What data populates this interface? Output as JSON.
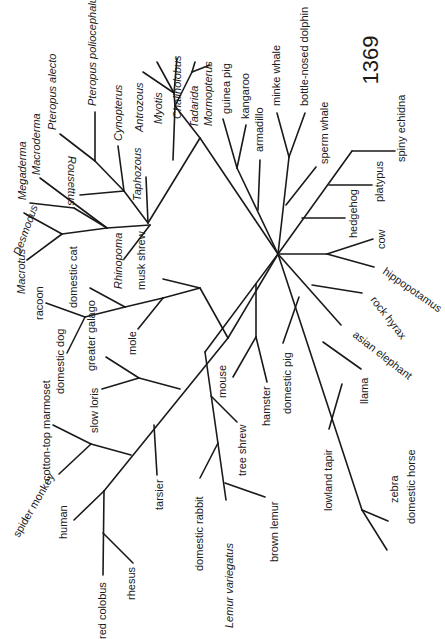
{
  "page": {
    "number": "1369"
  },
  "figure": {
    "type": "unrooted phylogenetic tree (rotated 90°)",
    "taxa": {
      "pteropus_poliocephalus": "Pteropus poliocephalus",
      "pteropus_alecto": "Pteropus alecto",
      "cynopterus": "Cynopterus",
      "antrozous": "Antrozous",
      "myotis": "Myotis",
      "chalinolobus": "Chalinolobus",
      "tadarida": "Tadarida",
      "mormopterus": "Mormopterus",
      "macroderma": "Macroderma",
      "megaderma": "Megaderma",
      "rousettus": "Rousettus",
      "desmodus": "Desmodus",
      "taphozous": "Taphozous",
      "macrotus": "Macrotus",
      "rhinopoma": "Rhinopoma",
      "guinea_pig": "guinea pig",
      "kangaroo": "kangaroo",
      "armadillo": "armadillo",
      "minke_whale": "minke whale",
      "bottle_nosed_dolphin": "bottle-nosed dolphin",
      "sperm_whale": "sperm whale",
      "spiny_echidna": "spiny echidna",
      "platypus": "platypus",
      "hedgehog": "hedgehog",
      "cow": "cow",
      "hippopotamus": "hippopotamus",
      "rock_hyrax": "rock hyrax",
      "asian_elephant": "asian elephant",
      "llama": "llama",
      "domestic_pig": "domestic pig",
      "lowland_tapir": "lowland tapir",
      "zebra": "zebra",
      "domestic_horse": "domestic horse",
      "racoon": "racoon",
      "domestic_cat": "domestic cat",
      "musk_shrew": "musk shrew",
      "domestic_dog": "domestic dog",
      "mole": "mole",
      "greater_galago": "greater galago",
      "slow_loris": "slow loris",
      "cotton_top_marmoset": "cotton-top marmoset",
      "spider_monkey": "spider monkey",
      "human": "human",
      "tarsier": "tarsier",
      "red_colobus": "red colobus",
      "rhesus": "rhesus",
      "domestic_rabbit": "domestic rabbit",
      "mouse": "mouse",
      "hamster": "hamster",
      "tree_shrew": "tree shrew",
      "lemur_variegatus": "Lemur variegatus",
      "brown_lemur": "brown lemur"
    }
  }
}
